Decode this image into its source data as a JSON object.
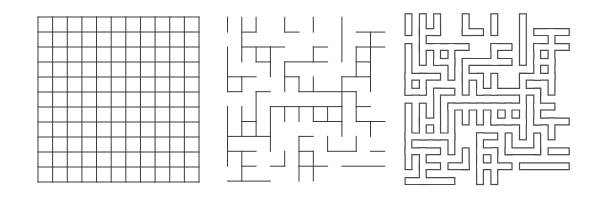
{
  "figure": {
    "panels": [
      {
        "id": "grid",
        "label": "Full grid lattice"
      },
      {
        "id": "maze",
        "label": "Maze (wall segments)"
      },
      {
        "id": "outline",
        "label": "Maze (outlined walls)"
      }
    ]
  },
  "grid": {
    "x0": 38,
    "y0": 17,
    "x1": 199,
    "y1": 182,
    "cols": 11,
    "rows": 11,
    "stroke": "#3a3a3a"
  },
  "maze": {
    "x0": 227.5,
    "y0": 17.2,
    "dx": 14.3,
    "dy": 14.9,
    "stroke": "#3a3a3a",
    "segments": [
      [
        0,
        0,
        0,
        1
      ],
      [
        1,
        0,
        1,
        3
      ],
      [
        2,
        0,
        2,
        1
      ],
      [
        2,
        2,
        2,
        3
      ],
      [
        4,
        0,
        4,
        1
      ],
      [
        4,
        1,
        5,
        1
      ],
      [
        6,
        0,
        6,
        1
      ],
      [
        8,
        0,
        8,
        3
      ],
      [
        1,
        1,
        2,
        1
      ],
      [
        9,
        1,
        11,
        1
      ],
      [
        10,
        1,
        10,
        5
      ],
      [
        1,
        2,
        4,
        2
      ],
      [
        6,
        2,
        7,
        2
      ],
      [
        9,
        2,
        11,
        2
      ],
      [
        3,
        2,
        3,
        4
      ],
      [
        6,
        2,
        6,
        3
      ],
      [
        9,
        2,
        9,
        4
      ],
      [
        2,
        3,
        3,
        3
      ],
      [
        4,
        3,
        7,
        3
      ],
      [
        9,
        3,
        10,
        3
      ],
      [
        0,
        2,
        0,
        5
      ],
      [
        4,
        3,
        4,
        5
      ],
      [
        0,
        4,
        2,
        4
      ],
      [
        4,
        4,
        5,
        4
      ],
      [
        8,
        4,
        10,
        4
      ],
      [
        1,
        4,
        1,
        5
      ],
      [
        5,
        4,
        5,
        5
      ],
      [
        6,
        4,
        6,
        5
      ],
      [
        8,
        4,
        8,
        8
      ],
      [
        0,
        5,
        1,
        5
      ],
      [
        2,
        5,
        3,
        5
      ],
      [
        5,
        5,
        9,
        5
      ],
      [
        2,
        5,
        2,
        8
      ],
      [
        9,
        5,
        9,
        7
      ],
      [
        3,
        6,
        8,
        6
      ],
      [
        9,
        6,
        10,
        6
      ],
      [
        0,
        6,
        0,
        10
      ],
      [
        1,
        6,
        1,
        8
      ],
      [
        3,
        6,
        3,
        9
      ],
      [
        4,
        6,
        4,
        7
      ],
      [
        5,
        6,
        5,
        7
      ],
      [
        6,
        6,
        6,
        7
      ],
      [
        7,
        6,
        7,
        7
      ],
      [
        1,
        7,
        2,
        7
      ],
      [
        6,
        7,
        8,
        7
      ],
      [
        9,
        7,
        11,
        7
      ],
      [
        10,
        7,
        10,
        8
      ],
      [
        0,
        8,
        3,
        8
      ],
      [
        5,
        8,
        6,
        8
      ],
      [
        5,
        8,
        5,
        11
      ],
      [
        7,
        8,
        7,
        9
      ],
      [
        9,
        8,
        9,
        9
      ],
      [
        0,
        9,
        2,
        9
      ],
      [
        7,
        9,
        9,
        9
      ],
      [
        5,
        9,
        6,
        9
      ],
      [
        10,
        9,
        11,
        9
      ],
      [
        1,
        9,
        1,
        11
      ],
      [
        4,
        9,
        4,
        10
      ],
      [
        6,
        9,
        6,
        11
      ],
      [
        1,
        10,
        2,
        10
      ],
      [
        3,
        10,
        4,
        10
      ],
      [
        5,
        10,
        7,
        10
      ],
      [
        8,
        10,
        11,
        10
      ],
      [
        0,
        11,
        3,
        11
      ]
    ]
  },
  "outline": {
    "x0": 408.5,
    "y0": 17.2,
    "dx": 14.3,
    "dy": 14.9,
    "stroke": "#4a4a4a",
    "outer_width": 8,
    "inner_width": 5.6
  }
}
